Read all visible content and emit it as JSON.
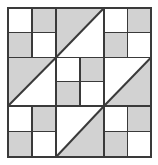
{
  "figure": {
    "name": "quilt-block-diagram",
    "width": 158,
    "height": 165
  },
  "colors": {
    "background": "#ffffff",
    "fill_light": "#ffffff",
    "fill_shaded": "#d2d2d2",
    "line": "#3a3a3a",
    "outer_border": "#3a3a3a"
  },
  "geometry": {
    "left": 8,
    "top": 8,
    "right": 151,
    "bottom": 157,
    "col_x": [
      8,
      56,
      104,
      151
    ],
    "row_y": [
      8,
      57.5,
      106,
      157
    ],
    "outer_stroke": 2.0,
    "grid_stroke": 1.6,
    "inner_stroke": 1.3,
    "diagonal_stroke": 2.0
  },
  "grid": {
    "rows": 3,
    "cols": 3,
    "cells": [
      {
        "id": "cell-r1c1",
        "name": "four-patch-top-left",
        "row": 0,
        "col": 0,
        "type": "four-patch",
        "patches": [
          "light",
          "shaded",
          "shaded",
          "light"
        ]
      },
      {
        "id": "cell-r1c2",
        "name": "half-square-triangle-top-center",
        "row": 0,
        "col": 1,
        "type": "half-square-triangle",
        "diagonal": "bottomleft-topright",
        "shaded_side": "upper-left"
      },
      {
        "id": "cell-r1c3",
        "name": "four-patch-top-right",
        "row": 0,
        "col": 2,
        "type": "four-patch",
        "patches": [
          "light",
          "shaded",
          "shaded",
          "light"
        ]
      },
      {
        "id": "cell-r2c1",
        "name": "half-square-triangle-middle-left",
        "row": 1,
        "col": 0,
        "type": "half-square-triangle",
        "diagonal": "bottomleft-topright",
        "shaded_side": "upper-left"
      },
      {
        "id": "cell-r2c2",
        "name": "four-patch-center",
        "row": 1,
        "col": 1,
        "type": "four-patch",
        "patches": [
          "light",
          "shaded",
          "shaded",
          "light"
        ]
      },
      {
        "id": "cell-r2c3",
        "name": "half-square-triangle-middle-right",
        "row": 1,
        "col": 2,
        "type": "half-square-triangle",
        "diagonal": "bottomleft-topright",
        "shaded_side": "lower-right"
      },
      {
        "id": "cell-r3c1",
        "name": "four-patch-bottom-left",
        "row": 2,
        "col": 0,
        "type": "four-patch",
        "patches": [
          "light",
          "shaded",
          "shaded",
          "light"
        ]
      },
      {
        "id": "cell-r3c2",
        "name": "half-square-triangle-bottom-center",
        "row": 2,
        "col": 1,
        "type": "half-square-triangle",
        "diagonal": "bottomleft-topright",
        "shaded_side": "lower-right"
      },
      {
        "id": "cell-r3c3",
        "name": "four-patch-bottom-right",
        "row": 2,
        "col": 2,
        "type": "four-patch",
        "patches": [
          "light",
          "shaded",
          "shaded",
          "light"
        ]
      }
    ]
  }
}
